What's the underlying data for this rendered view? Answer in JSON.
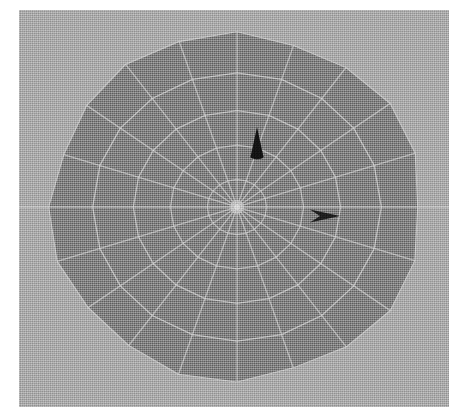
{
  "app": {
    "title": "3D Viewport",
    "view_label": "Top"
  },
  "canvas": {
    "width": 449,
    "height": 407,
    "background_color": "#a8a8a8",
    "margin_left_px": 19,
    "margin_top_px": 10,
    "margin_color": "#ffffff"
  },
  "viewport": {
    "x": 19,
    "y": 10,
    "width": 430,
    "height": 397,
    "background_color": "#a8a8a8"
  },
  "axis": {
    "name": "horizontal-axis-line",
    "orientation": "horizontal",
    "y": 197,
    "color": "#c6c6c6",
    "thickness": 1.4,
    "spans_full_width": true
  },
  "mesh": {
    "name": "polar-sphere-mesh",
    "shape": "faceted-disc",
    "center_x": 218,
    "center_y": 197,
    "radius_x": 185,
    "radius_y": 172,
    "fill_color": "#7d7d7d",
    "wire_color": "#cfcfcf",
    "wire_width": 1.3,
    "segments": 20,
    "rings": 5,
    "ring_radii_fraction": [
      0.16,
      0.36,
      0.56,
      0.78,
      1.0
    ],
    "silhouette_color": "#6f6f6f",
    "hub_color": "#d4d4d4",
    "hub_radius": 7
  },
  "markers": [
    {
      "name": "cone-marker-north",
      "label": "Cone",
      "shape": "cone",
      "x": 238,
      "y": 132,
      "width": 13,
      "height": 30,
      "rotation_deg": 0,
      "color": "#101010"
    },
    {
      "name": "arrow-marker-east",
      "label": "Arrow",
      "shape": "dart",
      "x": 306,
      "y": 206,
      "width": 30,
      "height": 13,
      "rotation_deg": 0,
      "color": "#1a1a1a"
    }
  ],
  "colors": {
    "background": "#a8a8a8",
    "mesh_fill": "#7d7d7d",
    "wireframe": "#cfcfcf",
    "marker": "#101010",
    "paper": "#ffffff"
  }
}
